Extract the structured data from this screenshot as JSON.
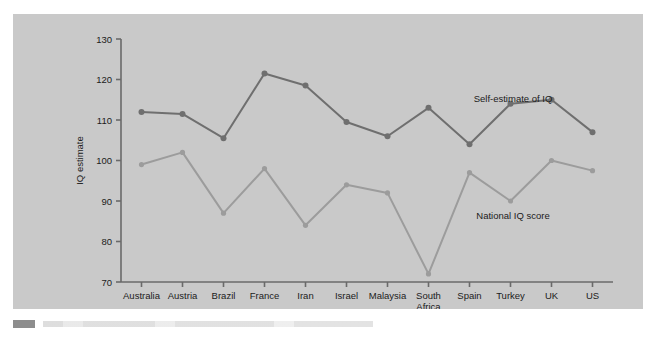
{
  "figure": {
    "background_color": "#c9c9c9",
    "page_color": "#ffffff"
  },
  "axes": {
    "y_title": "IQ estimate",
    "x_title": "Country",
    "y_ticks": [
      "130",
      "120",
      "110",
      "100",
      "90",
      "80",
      "70"
    ],
    "y_min": 70,
    "y_max": 130
  },
  "annotations": {
    "upper_series": "Self-estimate of IQ",
    "lower_series": "National IQ score"
  },
  "colors": {
    "upper_series": "#6f6f6f",
    "lower_series": "#9c9c9c",
    "axis": "#6a6a6a",
    "text": "#1b1b1b",
    "plot_background": "#c9c9c9"
  },
  "chart_data": {
    "type": "line",
    "title": "",
    "xlabel": "Country",
    "ylabel": "IQ estimate",
    "ylim": [
      70,
      130
    ],
    "yticks": [
      70,
      80,
      90,
      100,
      110,
      120,
      130
    ],
    "grid": false,
    "legend_position": "inline-annotation",
    "categories": [
      "Australia",
      "Austria",
      "Brazil",
      "France",
      "Iran",
      "Israel",
      "Malaysia",
      "South Africa",
      "Spain",
      "Turkey",
      "UK",
      "US"
    ],
    "category_labels_multiline": [
      [
        "Australia"
      ],
      [
        "Austria"
      ],
      [
        "Brazil"
      ],
      [
        "France"
      ],
      [
        "Iran"
      ],
      [
        "Israel"
      ],
      [
        "Malaysia"
      ],
      [
        "South",
        "Africa"
      ],
      [
        "Spain"
      ],
      [
        "Turkey"
      ],
      [
        "UK"
      ],
      [
        "US"
      ]
    ],
    "series": [
      {
        "name": "Self-estimate of IQ",
        "color": "#6f6f6f",
        "values": [
          112,
          111.5,
          105.5,
          121.5,
          118.5,
          109.5,
          106,
          113,
          104,
          114,
          115,
          107
        ]
      },
      {
        "name": "National IQ score",
        "color": "#9c9c9c",
        "values": [
          99,
          102,
          87,
          98,
          84,
          94,
          92,
          72,
          97,
          90,
          100,
          97.5
        ]
      }
    ]
  }
}
